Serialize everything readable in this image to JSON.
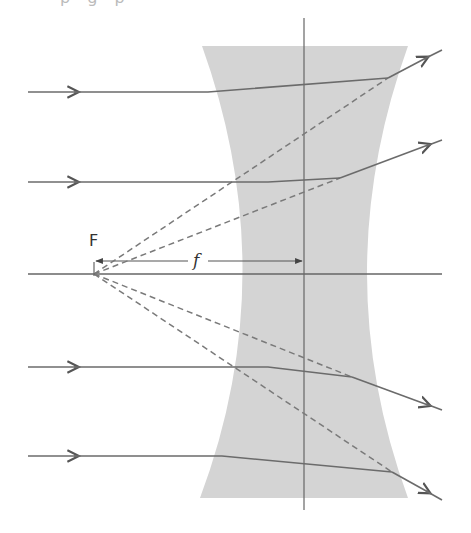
{
  "diagram": {
    "top_caption": "p    g    p",
    "labels": {
      "focal_point": "F",
      "focal_length": "f"
    },
    "colors": {
      "lens_fill": "#d4d4d4",
      "ray": "#6b6b6b",
      "axis": "#6b6b6b",
      "dashed": "#7a7a7a",
      "text": "#333333"
    },
    "lens": {
      "center_x": 304,
      "top_y": 46,
      "bottom_y": 498,
      "top_left_x": 202,
      "top_right_x": 408,
      "waist_left_x": 266,
      "waist_right_x": 340
    },
    "optical_axis": {
      "x1": 28,
      "x2": 442,
      "y": 274
    },
    "focal_point": {
      "x": 94,
      "y": 274
    },
    "incident_rays_y": [
      92,
      182,
      367,
      456
    ],
    "refracted_rays": [
      {
        "entry": [
          208,
          92
        ],
        "exit": [
          388,
          78
        ],
        "end": [
          442,
          50
        ]
      },
      {
        "entry": [
          268,
          182
        ],
        "exit": [
          340,
          178
        ],
        "end": [
          442,
          140
        ]
      },
      {
        "entry": [
          268,
          367
        ],
        "exit": [
          352,
          377
        ],
        "end": [
          442,
          410
        ]
      },
      {
        "entry": [
          222,
          456
        ],
        "exit": [
          392,
          472
        ],
        "end": [
          442,
          500
        ]
      }
    ]
  }
}
